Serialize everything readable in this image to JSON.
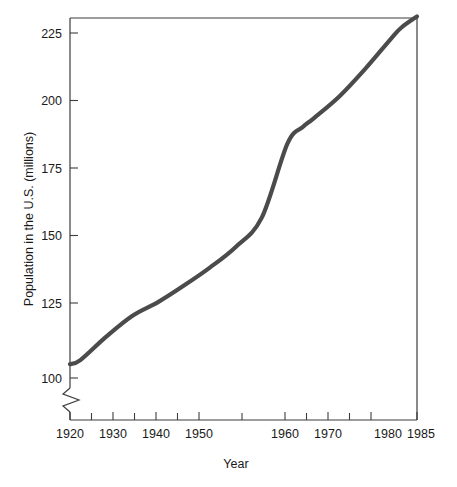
{
  "chart_data": {
    "type": "line",
    "title": "",
    "xlabel": "Year",
    "ylabel": "Population in the U.S. (millions)",
    "xlim": [
      1918,
      1985
    ],
    "ylim": [
      100,
      231
    ],
    "grid": false,
    "legend": null,
    "y_axis_break": true,
    "y_axis_break_note": "zigzag break below 100 on vertical axis",
    "xticks": [
      1920,
      1930,
      1940,
      1950,
      1960,
      1970,
      1980,
      1985
    ],
    "xtick_labels": [
      "1920",
      "1930",
      "1940",
      "1950",
      "1960",
      "1970",
      "1980",
      "1985"
    ],
    "x_minor_ticks": [
      1925,
      1935,
      1945,
      1955,
      1965,
      1975
    ],
    "yticks": [
      100,
      125,
      150,
      175,
      200,
      225
    ],
    "ytick_labels": [
      "100",
      "125",
      "150",
      "175",
      "200",
      "225"
    ],
    "line_color": "#4b4b4b",
    "series": [
      {
        "name": "U.S. Population",
        "x": [
          1918,
          1920,
          1925,
          1930,
          1935,
          1940,
          1945,
          1950,
          1955,
          1960,
          1963,
          1965,
          1970,
          1975,
          1980,
          1982,
          1985
        ],
        "values": [
          105,
          106.5,
          115,
          122.5,
          127.5,
          133.5,
          140,
          147.5,
          158,
          185,
          191,
          194,
          202,
          212,
          223,
          227,
          231
        ]
      }
    ]
  },
  "axes": {
    "y_title": "Population in the U.S. (millions)",
    "x_title": "Year"
  }
}
